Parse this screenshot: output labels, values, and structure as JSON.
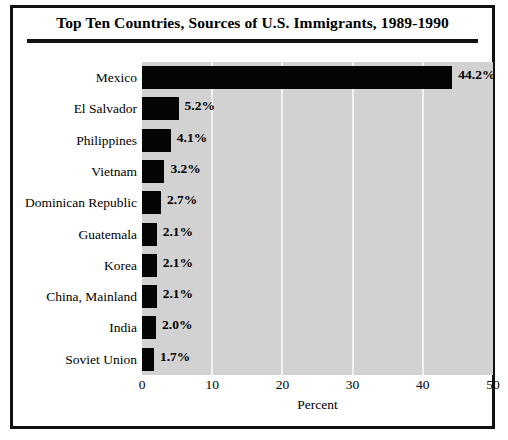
{
  "chart_data": {
    "type": "bar",
    "orientation": "horizontal",
    "title": "Top Ten Countries, Sources of U.S. Immigrants, 1989-1990",
    "xlabel": "Percent",
    "ylabel": "Country of Birth",
    "xlim": [
      0,
      50
    ],
    "xticks": [
      0,
      10,
      20,
      30,
      40,
      50
    ],
    "xtick_labels": [
      "0",
      "10",
      "20",
      "30",
      "40",
      "50"
    ],
    "grid": true,
    "legend": false,
    "categories": [
      "Mexico",
      "El Salvador",
      "Philippines",
      "Vietnam",
      "Dominican Republic",
      "Guatemala",
      "Korea",
      "China, Mainland",
      "India",
      "Soviet Union"
    ],
    "values": [
      44.2,
      5.2,
      4.1,
      3.2,
      2.7,
      2.1,
      2.1,
      2.1,
      2.0,
      1.7
    ],
    "value_labels": [
      "44.2%",
      "5.2%",
      "4.1%",
      "3.2%",
      "2.7%",
      "2.1%",
      "2.1%",
      "2.1%",
      "2.0%",
      "1.7%"
    ],
    "colors": {
      "bar": "#050505",
      "plot_background": "#d2d2d2",
      "gridline": "#f2f2f2",
      "frame": "#111111",
      "text": "#000000",
      "page_background": "#ffffff"
    }
  },
  "source_note": ""
}
